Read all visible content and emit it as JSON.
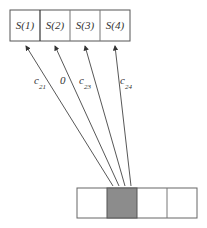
{
  "top_row": {
    "cells": [
      {
        "label": "S(1)"
      },
      {
        "label": "S(2)"
      },
      {
        "label": "S(3)"
      },
      {
        "label": "S(4)"
      }
    ]
  },
  "arrows": [
    {
      "label_main": "c",
      "label_sub": "21"
    },
    {
      "label_main": "0",
      "label_sub": ""
    },
    {
      "label_main": "c",
      "label_sub": "23"
    },
    {
      "label_main": "c",
      "label_sub": "24"
    }
  ],
  "bottom_row": {
    "cells": 4,
    "shaded_index": 1,
    "shade_color": "#8c8c8c"
  }
}
